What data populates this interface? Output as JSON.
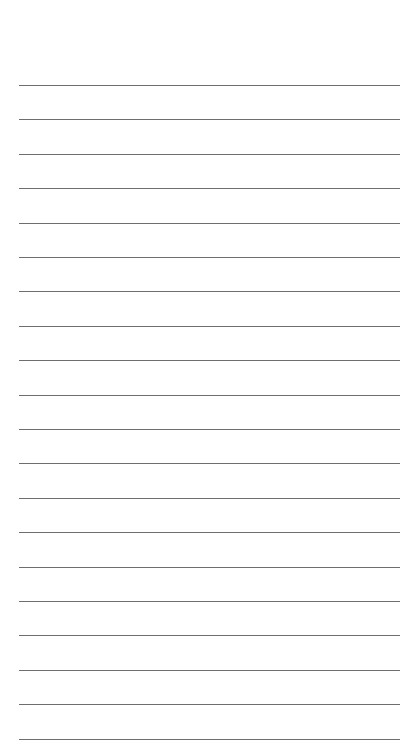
{
  "page": {
    "type": "blank-ruled-sheet",
    "background_color": "#ffffff",
    "rule_color": "#6e6e6e",
    "rule_count": 20,
    "first_rule_y": 85,
    "rule_spacing": 34.4,
    "rule_left": 19,
    "rule_width": 381
  }
}
